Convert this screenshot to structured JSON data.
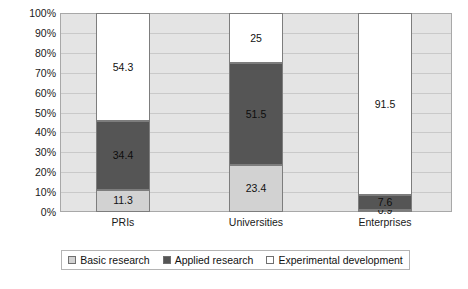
{
  "chart_data": {
    "type": "bar",
    "subtype": "100-percent-stacked-column",
    "title": "",
    "xlabel": "",
    "ylabel": "",
    "ylim": [
      0,
      100
    ],
    "y_unit": "%",
    "grid": true,
    "legend_position": "bottom",
    "categories": [
      "PRIs",
      "Universities",
      "Enterprises"
    ],
    "y_tick_labels": [
      "100%",
      "90%",
      "80%",
      "70%",
      "60%",
      "50%",
      "40%",
      "30%",
      "20%",
      "10%",
      "0%"
    ],
    "y_tick_values": [
      100,
      90,
      80,
      70,
      60,
      50,
      40,
      30,
      20,
      10,
      0
    ],
    "series": [
      {
        "name": "Basic research",
        "color": "#d2d2d2",
        "values": [
          11.3,
          23.4,
          0.9
        ],
        "labels": [
          "11.3",
          "23.4",
          "0.9"
        ]
      },
      {
        "name": "Applied research",
        "color": "#555555",
        "values": [
          34.4,
          51.5,
          7.6
        ],
        "labels": [
          "34.4",
          "51.5",
          "7.6"
        ]
      },
      {
        "name": "Experimental development",
        "color": "#ffffff",
        "values": [
          54.3,
          25.0,
          91.5
        ],
        "labels": [
          "54.3",
          "25",
          "91.5"
        ]
      }
    ]
  },
  "legend": {
    "items": [
      {
        "label": "Basic research",
        "color": "#d2d2d2"
      },
      {
        "label": "Applied research",
        "color": "#555555"
      },
      {
        "label": "Experimental development",
        "color": "#ffffff"
      }
    ]
  },
  "colors": {
    "plot_background": "#e4e4e4",
    "gridline": "#c9c9c9",
    "frame_border": "#a8a8a8",
    "bar_border": "#7d7d7d",
    "text": "#111111"
  }
}
